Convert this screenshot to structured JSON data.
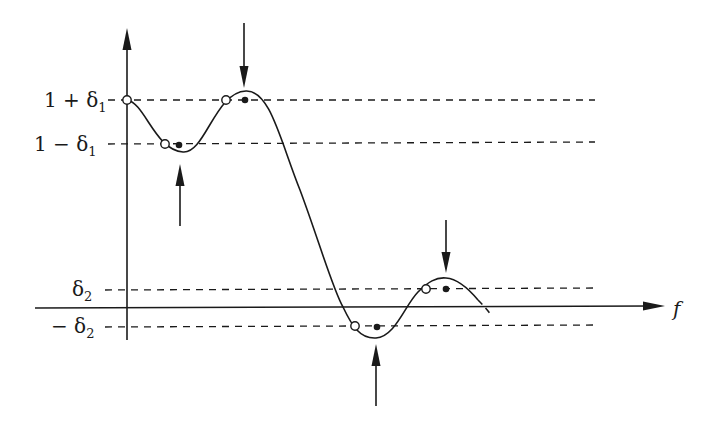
{
  "diagram": {
    "title": "",
    "axes": {
      "x_label": "f",
      "y_label": ""
    },
    "levels": [
      {
        "id": "upper_passband",
        "label": "1 + δ₁",
        "label_main": "1 + δ",
        "label_sub": "1",
        "y": 100
      },
      {
        "id": "lower_passband",
        "label": "1 − δ₁",
        "label_main": "1 − δ",
        "label_sub": "1",
        "y": 144
      },
      {
        "id": "upper_stopband",
        "label": "δ₂",
        "label_main": "δ",
        "label_sub": "2",
        "y": 289
      },
      {
        "id": "lower_stopband",
        "label": "− δ₂",
        "label_main": "− δ",
        "label_sub": "2",
        "y": 326
      }
    ],
    "open_points": [
      {
        "x": 127,
        "y": 100
      },
      {
        "x": 165,
        "y": 144
      },
      {
        "x": 226,
        "y": 100
      },
      {
        "x": 355,
        "y": 326
      },
      {
        "x": 426,
        "y": 289
      }
    ],
    "filled_points": [
      {
        "x": 179,
        "y": 145
      },
      {
        "x": 245,
        "y": 100
      },
      {
        "x": 377,
        "y": 327
      },
      {
        "x": 446,
        "y": 289
      }
    ],
    "extremum_arrows": [
      {
        "direction": "down",
        "x": 244,
        "from_y": 23,
        "to_y": 88
      },
      {
        "direction": "up",
        "x": 180,
        "from_y": 225,
        "to_y": 165
      },
      {
        "direction": "up",
        "x": 376,
        "from_y": 405,
        "to_y": 345
      },
      {
        "direction": "down",
        "x": 446,
        "from_y": 220,
        "to_y": 273
      }
    ],
    "colors": {
      "ink": "#1a1a1a",
      "background": "#ffffff"
    }
  }
}
